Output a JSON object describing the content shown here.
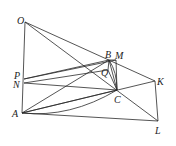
{
  "diagram": {
    "type": "geometry",
    "points": {
      "O": {
        "x": 25,
        "y": 22,
        "label": "O",
        "lx": 17,
        "ly": 24
      },
      "B": {
        "x": 109,
        "y": 60,
        "label": "B",
        "lx": 105,
        "ly": 58
      },
      "M": {
        "x": 116,
        "y": 60,
        "label": "M",
        "lx": 115,
        "ly": 59
      },
      "Q": {
        "x": 108,
        "y": 70,
        "label": "Q",
        "lx": 101,
        "ly": 76
      },
      "P": {
        "x": 24,
        "y": 79,
        "label": "P",
        "lx": 14,
        "ly": 79
      },
      "N": {
        "x": 24,
        "y": 83,
        "label": "N",
        "lx": 13,
        "ly": 88
      },
      "C": {
        "x": 117,
        "y": 90,
        "label": "C",
        "lx": 114,
        "ly": 103
      },
      "K": {
        "x": 155,
        "y": 81,
        "label": "K",
        "lx": 157,
        "ly": 85
      },
      "A": {
        "x": 22,
        "y": 113,
        "label": "A",
        "lx": 12,
        "ly": 117
      },
      "L": {
        "x": 158,
        "y": 121,
        "label": "L",
        "lx": 155,
        "ly": 134
      }
    },
    "segments": [
      [
        "O",
        "A"
      ],
      [
        "O",
        "K"
      ],
      [
        "O",
        "L"
      ],
      [
        "K",
        "L"
      ],
      [
        "A",
        "L"
      ],
      [
        "A",
        "B"
      ],
      [
        "A",
        "C"
      ],
      [
        "K",
        "A"
      ],
      [
        "P",
        "B"
      ],
      [
        "P",
        "M"
      ],
      [
        "N",
        "C"
      ],
      [
        "N",
        "Q"
      ],
      [
        "B",
        "C"
      ],
      [
        "M",
        "C"
      ],
      [
        "B",
        "Q"
      ],
      [
        "Q",
        "C"
      ],
      [
        "B",
        "M"
      ]
    ],
    "curves": [
      {
        "from": "A",
        "to": "C",
        "ctrl": [
          70,
          118
        ]
      },
      {
        "from": "B",
        "to": "C",
        "ctrl": [
          117,
          72
        ]
      }
    ]
  }
}
